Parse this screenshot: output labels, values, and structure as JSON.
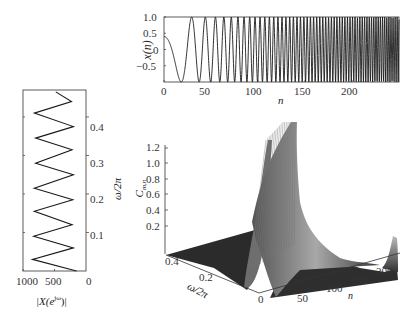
{
  "chart_data": [
    {
      "id": "time-signal",
      "type": "line",
      "title": "",
      "xlabel": "n",
      "ylabel": "x(n)",
      "xlim": [
        0,
        250
      ],
      "ylim": [
        -1.0,
        1.0
      ],
      "xticks": [
        "0",
        "50",
        "100",
        "150",
        "200"
      ],
      "yticks": [
        "1.0",
        "0.5",
        "0",
        "-0.5"
      ],
      "description": "Chirp-like signal: cosine with linearly increasing frequency, amplitude 1, starting near 0.4 at n=0; oscillation frequency rises from ~0 to ~0.45 cycles/sample across n=0..250",
      "series": [
        {
          "name": "x(n)",
          "x_start": 0,
          "x_end": 250,
          "amplitude": 1.0,
          "start_value": 0.4,
          "freq_start": 0.0,
          "freq_end": 0.47
        }
      ],
      "grid": false
    },
    {
      "id": "spectrum",
      "type": "line",
      "title": "",
      "xlabel": "|X(e^{jω})|",
      "ylabel": "ω/2π",
      "orientation": "horizontal (magnitude on x reversed, frequency on y)",
      "xlim": [
        1000,
        0
      ],
      "ylim": [
        0,
        0.47
      ],
      "xticks": [
        "1000",
        "500",
        "0"
      ],
      "yticks": [
        "0.1",
        "0.2",
        "0.3",
        "0.4"
      ],
      "description": "Zig-zag magnitude oscillating between ~150 and ~850 over normalized frequency 0 to 0.47 (about 8 peaks)",
      "series": [
        {
          "name": "|X|",
          "freq": [
            0.0,
            0.03,
            0.06,
            0.09,
            0.12,
            0.155,
            0.185,
            0.215,
            0.25,
            0.28,
            0.315,
            0.345,
            0.375,
            0.41,
            0.44,
            0.465
          ],
          "magnitude": [
            150,
            850,
            200,
            830,
            220,
            820,
            210,
            820,
            200,
            800,
            220,
            800,
            200,
            820,
            230,
            480
          ]
        }
      ],
      "grid": false
    },
    {
      "id": "time-frequency-surface",
      "type": "surface",
      "title": "",
      "xlabel": "n",
      "ylabel": "ω/2π",
      "zlabel": "C_{m,n}",
      "xticks": [
        "50",
        "100",
        "150",
        "200"
      ],
      "yticks": [
        "0",
        "0.2",
        "0.4"
      ],
      "zticks": [
        "0.2",
        "0.4",
        "0.6",
        "0.8",
        "1.0",
        "1.2"
      ],
      "zlim": [
        0,
        1.3
      ],
      "description": "3D surface with a diagonal ridge: energy concentrated along a linear time-frequency trajectory, peaking ~1.3 near low n / mid frequency, with small rise near n≈220",
      "grid": false
    }
  ],
  "labels": {
    "top_ylabel": "x(n)",
    "top_xlabel": "n",
    "left_ylabel": "ω/2π",
    "left_xlabel_main": "|X(e",
    "left_xlabel_sup": "jω",
    "left_xlabel_end": ")|",
    "surf_zlabel_main": "C",
    "surf_zlabel_sub": "m,n",
    "surf_ylabel": "ω/2π",
    "surf_xlabel": "n"
  },
  "ticks": {
    "top_y": [
      "1.0",
      "0.5",
      "0",
      "−0.5"
    ],
    "top_x": [
      "0",
      "50",
      "100",
      "150",
      "200"
    ],
    "left_y": [
      "0.4",
      "0.3",
      "0.2",
      "0.1",
      "0"
    ],
    "left_x": [
      "1000",
      "500"
    ],
    "surf_z": [
      "1.2",
      "1.0",
      "0.8",
      "0.6",
      "0.4",
      "0.2"
    ],
    "surf_w": [
      "0.4",
      "0.2",
      "0"
    ],
    "surf_n": [
      "50",
      "100",
      "150",
      "200"
    ]
  },
  "colors": {
    "line": "#1a1a1a",
    "axis": "#333333",
    "surface_dark": "#2b2b2b",
    "surface_light": "#9a9a9a"
  }
}
